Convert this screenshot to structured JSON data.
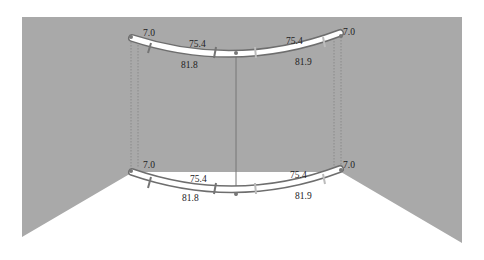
{
  "colors": {
    "wall": "#a9a9a9",
    "background": "#ffffff",
    "rail": "#6e6e6e",
    "rail_fill": "#ffffff",
    "tick_dark": "#757575",
    "tick_light": "#bcbcbc",
    "dotted": "#8a8a8a"
  },
  "top_rail": {
    "end_left_label": "7.0",
    "end_right_label": "7.0",
    "inner_left_label": "75.4",
    "inner_right_label": "75.4",
    "outer_left_label": "81.8",
    "outer_right_label": "81.9"
  },
  "bottom_rail": {
    "end_left_label": "7.0",
    "end_right_label": "7.0",
    "inner_left_label": "75.4",
    "inner_right_label": "75.4",
    "outer_left_label": "81.8",
    "outer_right_label": "81.9"
  }
}
